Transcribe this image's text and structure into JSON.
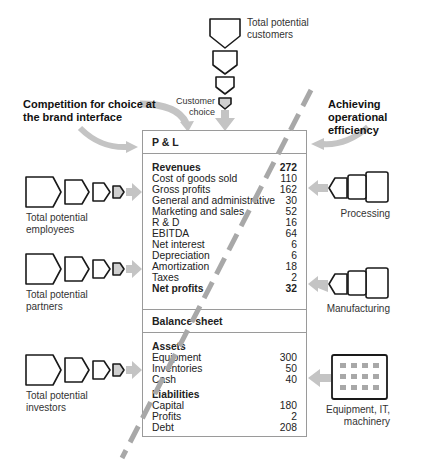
{
  "top": {
    "customers_label_1": "Total potential",
    "customers_label_2": "customers",
    "choice_label_1": "Customer",
    "choice_label_2": "choice"
  },
  "headings": {
    "competition_1": "Competition for choice at",
    "competition_2": "the brand interface",
    "operational_1": "Achieving operational",
    "operational_2": "efficiency"
  },
  "left_funnels": [
    {
      "label_1": "Total potential",
      "label_2": "employees"
    },
    {
      "label_1": "Total potential",
      "label_2": "partners"
    },
    {
      "label_1": "Total potential",
      "label_2": "investors"
    }
  ],
  "right_inputs": [
    {
      "label_1": "Processing",
      "label_2": ""
    },
    {
      "label_1": "Manufacturing",
      "label_2": ""
    },
    {
      "label_1": "Equipment, IT,",
      "label_2": "machinery"
    }
  ],
  "pnl": {
    "title": "P & L",
    "rows": [
      {
        "label": "Revenues",
        "value": "272",
        "bold": true
      },
      {
        "label": "Cost of goods sold",
        "value": "110"
      },
      {
        "label": "Gross profits",
        "value": "162"
      },
      {
        "label": "General and administrative",
        "value": "30"
      },
      {
        "label": "Marketing and sales",
        "value": "52"
      },
      {
        "label": "R & D",
        "value": "16"
      },
      {
        "label": "EBITDA",
        "value": "64"
      },
      {
        "label": "Net interest",
        "value": "6"
      },
      {
        "label": "Depreciation",
        "value": "6"
      },
      {
        "label": "Amortization",
        "value": "18"
      },
      {
        "label": "Taxes",
        "value": "2"
      },
      {
        "label": "Net profits",
        "value": "32",
        "bold": true
      }
    ]
  },
  "balance": {
    "title": "Balance sheet",
    "assets_heading": "Assets",
    "assets": [
      {
        "label": "Equipment",
        "value": "300"
      },
      {
        "label": "Inventories",
        "value": "50"
      },
      {
        "label": "Cash",
        "value": "40"
      }
    ],
    "liabilities_heading": "Liabilities",
    "liabilities": [
      {
        "label": "Capital",
        "value": "180"
      },
      {
        "label": "Profits",
        "value": "2"
      },
      {
        "label": "Debt",
        "value": "208"
      }
    ]
  },
  "colors": {
    "arrow_gray": "#c4c4c4",
    "dash_gray": "#a8a8a8",
    "outline": "#1a1a1a",
    "box_border": "#9a9a9a",
    "fill_light": "#d8d8d8"
  }
}
